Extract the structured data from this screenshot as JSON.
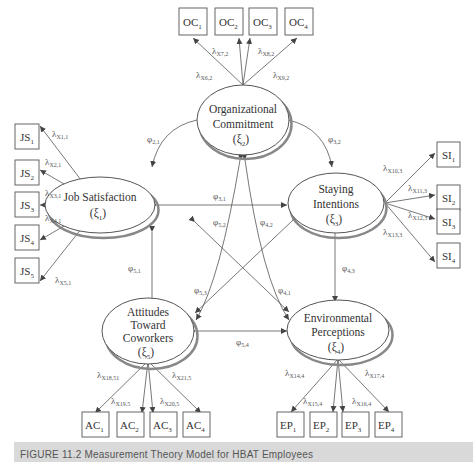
{
  "diagram": {
    "type": "structural equation measurement model (path diagram)",
    "constructs": [
      {
        "id": "oc",
        "name_line1": "Organizational",
        "name_line2": "Commitment",
        "symbol": "(ξ",
        "sub": "2",
        "close": ")"
      },
      {
        "id": "js",
        "name_line1": "Job Satisfaction",
        "symbol": "(ξ",
        "sub": "1",
        "close": ")"
      },
      {
        "id": "si",
        "name_line1": "Staying",
        "name_line2": "Intentions",
        "symbol": "(ξ",
        "sub": "3",
        "close": ")"
      },
      {
        "id": "ac",
        "name_line1": "Attitudes",
        "name_line2": "Toward",
        "name_line3": "Coworkers",
        "symbol": "(ξ",
        "sub": "5",
        "close": ")"
      },
      {
        "id": "ep",
        "name_line1": "Environmental",
        "name_line2": "Perceptions",
        "symbol": "(ξ",
        "sub": "4",
        "close": ")"
      }
    ],
    "indicators": {
      "oc": [
        {
          "base": "OC",
          "sub": "1"
        },
        {
          "base": "OC",
          "sub": "2"
        },
        {
          "base": "OC",
          "sub": "3"
        },
        {
          "base": "OC",
          "sub": "4"
        }
      ],
      "js": [
        {
          "base": "JS",
          "sub": "1"
        },
        {
          "base": "JS",
          "sub": "2"
        },
        {
          "base": "JS",
          "sub": "3"
        },
        {
          "base": "JS",
          "sub": "4"
        },
        {
          "base": "JS",
          "sub": "5"
        }
      ],
      "si": [
        {
          "base": "SI",
          "sub": "1"
        },
        {
          "base": "SI",
          "sub": "2"
        },
        {
          "base": "SI",
          "sub": "3"
        },
        {
          "base": "SI",
          "sub": "4"
        }
      ],
      "ac": [
        {
          "base": "AC",
          "sub": "1"
        },
        {
          "base": "AC",
          "sub": "2"
        },
        {
          "base": "AC",
          "sub": "3"
        },
        {
          "base": "AC",
          "sub": "4"
        }
      ],
      "ep": [
        {
          "base": "EP",
          "sub": "1"
        },
        {
          "base": "EP",
          "sub": "2"
        },
        {
          "base": "EP",
          "sub": "3"
        },
        {
          "base": "EP",
          "sub": "4"
        }
      ]
    },
    "loadings": {
      "oc": [
        {
          "sym": "λ",
          "sub": "X6,2"
        },
        {
          "sym": "λ",
          "sub": "X7,2"
        },
        {
          "sym": "λ",
          "sub": "X8,2"
        },
        {
          "sym": "λ",
          "sub": "X9,2"
        }
      ],
      "js": [
        {
          "sym": "λ",
          "sub": "X1,1"
        },
        {
          "sym": "λ",
          "sub": "X2,1"
        },
        {
          "sym": "λ",
          "sub": "X3,1"
        },
        {
          "sym": "λ",
          "sub": "X4,1"
        },
        {
          "sym": "λ",
          "sub": "X5,1"
        }
      ],
      "si": [
        {
          "sym": "λ",
          "sub": "X10,3"
        },
        {
          "sym": "λ",
          "sub": "X11,3"
        },
        {
          "sym": "λ",
          "sub": "X12,3"
        },
        {
          "sym": "λ",
          "sub": "X13,3"
        }
      ],
      "ac": [
        {
          "sym": "λ",
          "sub": "X18,51"
        },
        {
          "sym": "λ",
          "sub": "X19,5"
        },
        {
          "sym": "λ",
          "sub": "X20,5"
        },
        {
          "sym": "λ",
          "sub": "X21,5"
        }
      ],
      "ep": [
        {
          "sym": "λ",
          "sub": "X14,4"
        },
        {
          "sym": "λ",
          "sub": "X15,4"
        },
        {
          "sym": "λ",
          "sub": "X16,4"
        },
        {
          "sym": "λ",
          "sub": "X17,4"
        }
      ]
    },
    "covariances": [
      {
        "sym": "φ",
        "sub": "2,1"
      },
      {
        "sym": "φ",
        "sub": "3,2"
      },
      {
        "sym": "φ",
        "sub": "3,1"
      },
      {
        "sym": "φ",
        "sub": "5,2"
      },
      {
        "sym": "φ",
        "sub": "4,2"
      },
      {
        "sym": "φ",
        "sub": "5,1"
      },
      {
        "sym": "φ",
        "sub": "5,3"
      },
      {
        "sym": "φ",
        "sub": "4,1"
      },
      {
        "sym": "φ",
        "sub": "4,3"
      },
      {
        "sym": "φ",
        "sub": "5,4"
      }
    ]
  },
  "caption": {
    "text": "FIGURE 11.2   Measurement Theory Model for HBAT Employees"
  }
}
